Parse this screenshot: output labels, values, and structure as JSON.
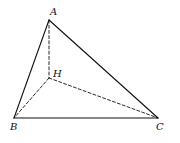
{
  "figure": {
    "type": "tetrahedron",
    "vertices": {
      "A": {
        "label": "A",
        "x": 49,
        "y": 20,
        "lx": 50,
        "ly": 15
      },
      "H": {
        "label": "H",
        "x": 49,
        "y": 78,
        "lx": 53,
        "ly": 77
      },
      "B": {
        "label": "B",
        "x": 14,
        "y": 118,
        "lx": 10,
        "ly": 130
      },
      "C": {
        "label": "C",
        "x": 158,
        "y": 118,
        "lx": 156,
        "ly": 130
      }
    },
    "edges": [
      {
        "from": "A",
        "to": "B",
        "style": "solid"
      },
      {
        "from": "A",
        "to": "C",
        "style": "solid"
      },
      {
        "from": "B",
        "to": "C",
        "style": "solid"
      },
      {
        "from": "A",
        "to": "H",
        "style": "dashed"
      },
      {
        "from": "H",
        "to": "B",
        "style": "dashed"
      },
      {
        "from": "H",
        "to": "C",
        "style": "dashed"
      }
    ]
  }
}
